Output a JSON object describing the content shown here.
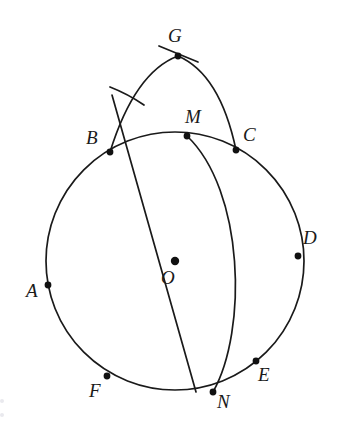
{
  "figure": {
    "kind": "geometry-construction-diagram",
    "background_color": "#ffffff",
    "ink_color": "#1a1a1a",
    "width": 341,
    "height": 433,
    "center_label": "O",
    "center_point": {
      "x": 175,
      "y": 261
    },
    "main_circle": {
      "cx": 175,
      "cy": 261,
      "r": 129
    },
    "labels": {
      "G": "G",
      "B": "B",
      "M": "M",
      "C": "C",
      "D": "D",
      "A": "A",
      "O": "O",
      "F": "F",
      "N": "N",
      "E": "E"
    },
    "points": [
      {
        "name": "G",
        "label": "G",
        "x": 178,
        "y": 56,
        "label_x": 168,
        "label_y": 26,
        "on": "apex-of-arc-BGC"
      },
      {
        "name": "B",
        "label": "B",
        "x": 110,
        "y": 152,
        "label_x": 86,
        "label_y": 128,
        "on": "main-circle"
      },
      {
        "name": "M",
        "label": "M",
        "x": 187,
        "y": 136,
        "label_x": 185,
        "label_y": 107,
        "on": "main-circle"
      },
      {
        "name": "C",
        "label": "C",
        "x": 236,
        "y": 150,
        "label_x": 243,
        "label_y": 125,
        "on": "main-circle"
      },
      {
        "name": "D",
        "label": "D",
        "x": 298,
        "y": 256,
        "label_x": 303,
        "label_y": 228,
        "on": "main-circle"
      },
      {
        "name": "A",
        "label": "A",
        "x": 48,
        "y": 285,
        "label_x": 26,
        "label_y": 281,
        "on": "main-circle"
      },
      {
        "name": "F",
        "label": "F",
        "x": 107,
        "y": 376,
        "label_x": 89,
        "label_y": 381,
        "on": "main-circle"
      },
      {
        "name": "N",
        "label": "N",
        "x": 213,
        "y": 392,
        "label_x": 217,
        "label_y": 392,
        "on": "main-circle"
      },
      {
        "name": "E",
        "label": "E",
        "x": 256,
        "y": 361,
        "label_x": 258,
        "label_y": 365,
        "on": "main-circle"
      }
    ],
    "curves": [
      {
        "name": "main-circle",
        "description": "circle centred at O passing through A, B, M, C, D, E, N, F"
      },
      {
        "name": "arc-b-g-c",
        "description": "arc rising from B over apex G and descending to C"
      },
      {
        "name": "arc-m-n",
        "description": "arc from M bulging right and meeting the circle again at N"
      },
      {
        "name": "line-g-m-n",
        "description": "straight line through G, M and N, extended below N"
      },
      {
        "name": "tick-at-g",
        "description": "short crossing construction tick through apex G"
      },
      {
        "name": "tick-on-arc",
        "description": "short construction arc crossing the B-G arc"
      }
    ]
  }
}
